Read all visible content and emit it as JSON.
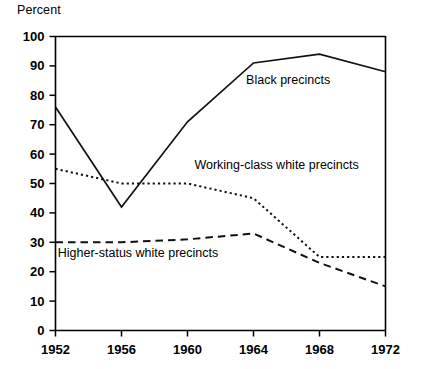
{
  "chart_data": {
    "type": "line",
    "title": "",
    "ylabel": "Percent",
    "xlabel": "",
    "ylim": [
      0,
      100
    ],
    "yticks": [
      0,
      10,
      20,
      30,
      40,
      50,
      60,
      70,
      80,
      90,
      100
    ],
    "grid": false,
    "legend_position": "inline-annotations",
    "categories": [
      "1952",
      "1956",
      "1960",
      "1964",
      "1968",
      "1972"
    ],
    "x": [
      1952,
      1956,
      1960,
      1964,
      1968,
      1972
    ],
    "series": [
      {
        "name": "Black precincts",
        "style": "solid",
        "values": [
          76,
          42,
          71,
          91,
          94,
          88
        ]
      },
      {
        "name": "Working-class white precincts",
        "style": "dotted",
        "values": [
          55,
          50,
          50,
          45,
          25,
          25
        ]
      },
      {
        "name": "Higher-status white precincts",
        "style": "dashed",
        "values": [
          30,
          30,
          31,
          33,
          23,
          15
        ]
      }
    ],
    "annotations": [
      {
        "text": "Black precincts",
        "x": 1966.1,
        "y": 84
      },
      {
        "text": "Working-class white precincts",
        "x": 1965.4,
        "y": 55
      },
      {
        "text": "Higher-status white precincts",
        "x": 1957.0,
        "y": 25
      }
    ],
    "colors": {
      "line": "#111111",
      "axis": "#000000",
      "background": "#ffffff"
    }
  }
}
